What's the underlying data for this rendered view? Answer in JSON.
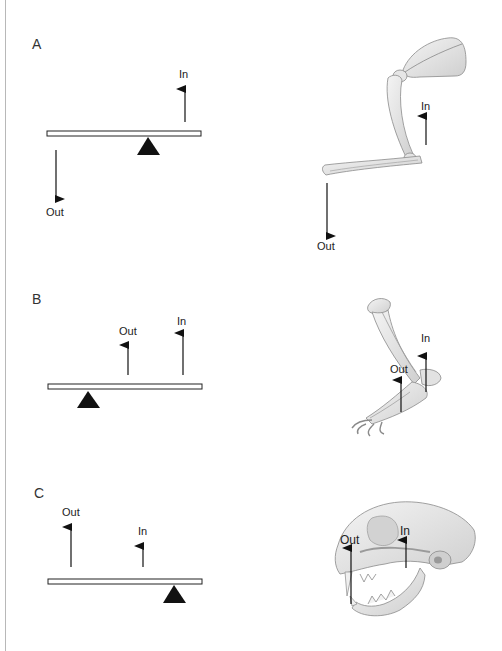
{
  "panels": [
    {
      "letter": "A",
      "lever": {
        "in_label": "In",
        "out_label": "Out"
      },
      "anatomy": {
        "subject": "forelimb skeleton (scapula, humerus, forearm)",
        "in_label": "In",
        "out_label": "Out"
      }
    },
    {
      "letter": "B",
      "lever": {
        "in_label": "In",
        "out_label": "Out"
      },
      "anatomy": {
        "subject": "hindlimb skeleton (tibia, ankle, foot)",
        "in_label": "In",
        "out_label": "Out"
      }
    },
    {
      "letter": "C",
      "lever": {
        "in_label": "In",
        "out_label": "Out"
      },
      "anatomy": {
        "subject": "cat skull with open jaw",
        "in_label": "In",
        "out_label": "Out"
      }
    }
  ],
  "colors": {
    "ink": "#111111",
    "bone_fill": "#ececec",
    "bone_shade": "#bdbdbd",
    "bone_outline": "#8a8a8a",
    "edge_line": "#b8b8b8"
  }
}
